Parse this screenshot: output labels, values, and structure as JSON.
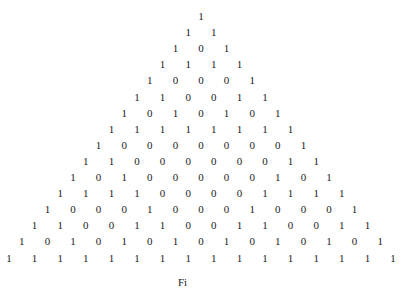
{
  "figure": {
    "rows": [
      [
        1
      ],
      [
        1,
        1
      ],
      [
        1,
        0,
        1
      ],
      [
        1,
        1,
        1,
        1
      ],
      [
        1,
        0,
        0,
        0,
        1
      ],
      [
        1,
        1,
        0,
        0,
        1,
        1
      ],
      [
        1,
        0,
        1,
        0,
        1,
        0,
        1
      ],
      [
        1,
        1,
        1,
        1,
        1,
        1,
        1,
        1
      ],
      [
        1,
        0,
        0,
        0,
        0,
        0,
        0,
        0,
        1
      ],
      [
        1,
        1,
        0,
        0,
        0,
        0,
        0,
        0,
        1,
        1
      ],
      [
        1,
        0,
        1,
        0,
        0,
        0,
        0,
        0,
        1,
        0,
        1
      ],
      [
        1,
        1,
        1,
        1,
        0,
        0,
        0,
        0,
        1,
        1,
        1,
        1
      ],
      [
        1,
        0,
        0,
        0,
        1,
        0,
        0,
        0,
        1,
        0,
        0,
        0,
        1
      ],
      [
        1,
        1,
        0,
        0,
        1,
        1,
        0,
        0,
        1,
        1,
        0,
        0,
        1,
        1
      ],
      [
        1,
        0,
        1,
        0,
        1,
        0,
        1,
        0,
        1,
        0,
        1,
        0,
        1,
        0,
        1
      ],
      [
        1,
        1,
        1,
        1,
        1,
        1,
        1,
        1,
        1,
        1,
        1,
        1,
        1,
        1,
        1,
        1
      ]
    ],
    "caption": "Fi"
  }
}
